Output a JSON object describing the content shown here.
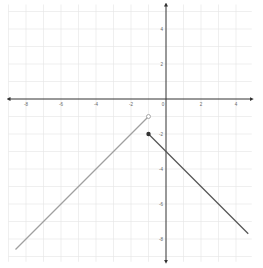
{
  "chart_data": {
    "type": "line",
    "title": "",
    "xlabel": "",
    "ylabel": "",
    "xlim": [
      -9,
      4.9
    ],
    "ylim": [
      -9.3,
      5.4
    ],
    "grid": true,
    "x_ticks": [
      -8,
      -6,
      -4,
      -2,
      0,
      2,
      4
    ],
    "y_ticks": [
      4,
      2,
      -2,
      -4,
      -6,
      -8
    ],
    "x_tick_labels": [
      "-8",
      "-6",
      "-4",
      "-2",
      "0",
      "2",
      "4"
    ],
    "y_tick_labels": [
      "4",
      "2",
      "-2",
      "-4",
      "-6",
      "-8"
    ],
    "series": [
      {
        "name": "segment-left",
        "equation": "y = x",
        "points": [
          [
            -8.6,
            -8.6
          ],
          [
            -1,
            -1
          ]
        ],
        "start_marker": "none",
        "end_marker": "open-circle",
        "color": "#a0a0a0"
      },
      {
        "name": "segment-right",
        "equation": "y = -x - 3",
        "points": [
          [
            -1,
            -2
          ],
          [
            4.7,
            -7.7
          ]
        ],
        "start_marker": "closed-circle",
        "end_marker": "none",
        "color": "#555555"
      }
    ]
  },
  "layout": {
    "origin_px": [
      166,
      99
    ],
    "unit_px": 17.5
  }
}
